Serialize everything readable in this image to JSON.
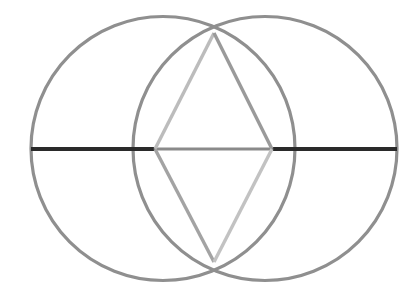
{
  "figure": {
    "background_color": "#ffffff",
    "canvas": {
      "width": 420,
      "height": 291
    },
    "circles": [
      {
        "name": "left-circle",
        "cx": 163,
        "cy": 148.5,
        "r": 132,
        "stroke": "#8f8f8f",
        "stroke_width": 3.2,
        "fill": "none"
      },
      {
        "name": "right-circle",
        "cx": 265,
        "cy": 148.5,
        "r": 132,
        "stroke": "#8f8f8f",
        "stroke_width": 3.2,
        "fill": "none"
      }
    ],
    "points": [
      {
        "name": "left-vertex",
        "x": 155,
        "y": 149
      },
      {
        "name": "right-vertex",
        "x": 272,
        "y": 149
      },
      {
        "name": "top-vertex",
        "x": 214,
        "y": 33
      },
      {
        "name": "bottom-vertex",
        "x": 214,
        "y": 262
      },
      {
        "name": "left-extreme",
        "x": 31,
        "y": 149
      },
      {
        "name": "right-extreme",
        "x": 397,
        "y": 149
      }
    ],
    "segments": [
      {
        "name": "horizontal-axis-left-dark",
        "x1": 31,
        "y1": 149,
        "x2": 156,
        "y2": 149,
        "stroke": "#2a2a2a",
        "stroke_width": 4.2
      },
      {
        "name": "horizontal-axis-middle-gray",
        "x1": 155,
        "y1": 149,
        "x2": 273,
        "y2": 149,
        "stroke": "#8a8a8a",
        "stroke_width": 3.2
      },
      {
        "name": "horizontal-axis-right-dark",
        "x1": 272,
        "y1": 149,
        "x2": 397,
        "y2": 149,
        "stroke": "#2a2a2a",
        "stroke_width": 4.2
      },
      {
        "name": "rhombus-edge-top-left",
        "x1": 214,
        "y1": 33,
        "x2": 155,
        "y2": 149,
        "stroke": "#bcbcbc",
        "stroke_width": 3.4
      },
      {
        "name": "rhombus-edge-top-right",
        "x1": 214,
        "y1": 33,
        "x2": 272,
        "y2": 149,
        "stroke": "#9a9a9a",
        "stroke_width": 3.4
      },
      {
        "name": "rhombus-edge-bottom-left",
        "x1": 155,
        "y1": 149,
        "x2": 214,
        "y2": 262,
        "stroke": "#a3a3a3",
        "stroke_width": 3.4
      },
      {
        "name": "rhombus-edge-bottom-right",
        "x1": 272,
        "y1": 149,
        "x2": 214,
        "y2": 262,
        "stroke": "#c2c2c2",
        "stroke_width": 3.4
      }
    ]
  }
}
